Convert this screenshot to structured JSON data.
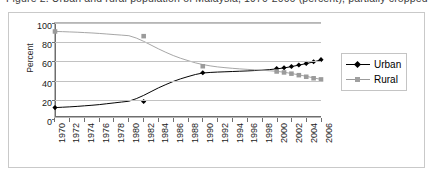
{
  "caption": {
    "text": "Figure 2. Urban and rural population of Malaysia, 1970-2006 (percent), partially cropped"
  },
  "chart_data": {
    "type": "line",
    "title": "",
    "xlabel": "",
    "ylabel": "Percent",
    "ylim": [
      0,
      100
    ],
    "ytick_labels": [
      "100",
      "80",
      "60",
      "40",
      "20",
      "0"
    ],
    "ytick_values": [
      100,
      80,
      60,
      40,
      20,
      0
    ],
    "grid": true,
    "legend_position": "right",
    "x": [
      1970,
      1971,
      1972,
      1973,
      1974,
      1975,
      1976,
      1977,
      1978,
      1979,
      1980,
      1981,
      1982,
      1983,
      1984,
      1985,
      1986,
      1987,
      1988,
      1989,
      1990,
      1991,
      1992,
      1993,
      1994,
      1995,
      1996,
      1997,
      1998,
      1999,
      2000,
      2001,
      2002,
      2003,
      2004,
      2005,
      2006
    ],
    "xtick_labels": [
      "1970",
      "1972",
      "1974",
      "1976",
      "1978",
      "1980",
      "1982",
      "1984",
      "1986",
      "1988",
      "1990",
      "1992",
      "1994",
      "1996",
      "1998",
      "2000",
      "2002",
      "2004",
      "2006"
    ],
    "series": [
      {
        "name": "Urban",
        "color": "#000000",
        "marker": "diamond",
        "values": [
          10,
          10.4,
          10.8,
          11.3,
          11.9,
          12.5,
          13.2,
          14.1,
          15.0,
          15.9,
          16.8,
          19.5,
          23.0,
          27.0,
          31.0,
          34.5,
          37.8,
          40.6,
          43.0,
          45.2,
          46.8,
          47.4,
          47.8,
          48.1,
          48.4,
          48.7,
          49.0,
          49.4,
          49.8,
          50.4,
          51.2,
          52.2,
          53.6,
          55.2,
          56.8,
          58.6,
          60.8
        ],
        "marker_years": [
          1970,
          1982,
          1990,
          2000,
          2001,
          2002,
          2003,
          2004,
          2005,
          2006
        ],
        "marker_values": [
          10,
          16.5,
          47,
          51.5,
          52.4,
          53.8,
          55.3,
          57,
          58.8,
          61
        ]
      },
      {
        "name": "Rural",
        "color": "#9b9b9b",
        "marker": "square",
        "values": [
          91,
          90.8,
          90.5,
          90.2,
          89.8,
          89.4,
          88.9,
          88.3,
          87.7,
          87.1,
          86.5,
          84.0,
          80.5,
          76.5,
          72.5,
          68.8,
          65.4,
          62.5,
          60.0,
          57.6,
          55.8,
          54.4,
          53.3,
          52.5,
          51.8,
          51.2,
          50.7,
          50.2,
          49.7,
          49.2,
          48.6,
          47.6,
          46.3,
          44.8,
          43.3,
          41.6,
          40.0
        ],
        "marker_years": [
          1970,
          1982,
          1990,
          2000,
          2001,
          2002,
          2003,
          2004,
          2005,
          2006
        ],
        "marker_values": [
          91,
          86,
          54,
          48.4,
          47.4,
          46.1,
          44.5,
          42.8,
          41.2,
          40
        ]
      }
    ]
  }
}
